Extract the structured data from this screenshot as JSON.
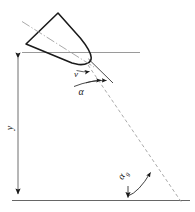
{
  "figure": {
    "type": "projectile-ballistics-diagram",
    "background_color": "#ffffff",
    "line_color": "#1a1a1a",
    "thin_line_color": "#8a8a8a",
    "dashed_color": "#9a9a9a"
  },
  "labels": {
    "velocity": "v",
    "attack_angle": "α",
    "ground_angle_base": "α",
    "ground_angle_sub": "g",
    "height": "y"
  },
  "geometry": {
    "horizontal_reference_line": {
      "x1": 22,
      "y1": 52,
      "x2": 140,
      "y2": 52
    },
    "ground_line": {
      "x1": 12,
      "y1": 200,
      "x2": 190,
      "y2": 200
    },
    "height_arrow": {
      "x": 18,
      "y_top": 52,
      "y_bottom": 200
    },
    "body_outline": [
      {
        "x": 58,
        "y": 13
      },
      {
        "x": 26,
        "y": 44
      },
      {
        "x": 72,
        "y": 63
      },
      {
        "x": 88,
        "y": 60
      }
    ],
    "body_axis": {
      "x1": 22,
      "y1": 22,
      "x2": 93,
      "y2": 67
    },
    "velocity_vector": {
      "x1": 88,
      "y1": 60,
      "x2": 112,
      "y2": 84
    },
    "trajectory": {
      "x1": 88,
      "y1": 66,
      "x2": 181,
      "y2": 202
    },
    "attack_angle_arc": {
      "cx": 88,
      "cy": 62,
      "r": 26
    },
    "ground_angle_arc": {
      "cx": 128,
      "cy": 200,
      "r": 33
    }
  }
}
